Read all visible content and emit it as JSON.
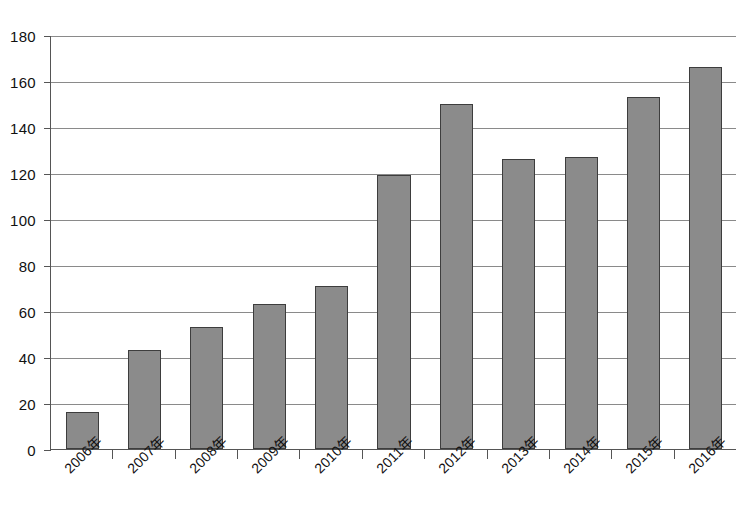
{
  "title": "",
  "chart_data": {
    "type": "bar",
    "title": "",
    "xlabel": "",
    "ylabel": "",
    "categories": [
      "2006年",
      "2007年",
      "2008年",
      "2009年",
      "2010年",
      "2011年",
      "2012年",
      "2013年",
      "2014年",
      "2015年",
      "2016年"
    ],
    "values": [
      16,
      43,
      53,
      63,
      71,
      119,
      150,
      126,
      127,
      153,
      166
    ],
    "series": [
      {
        "name": "件数",
        "values": [
          16,
          43,
          53,
          63,
          71,
          119,
          150,
          126,
          127,
          153,
          166
        ]
      }
    ],
    "ylim": [
      0,
      180
    ],
    "ytick_values": [
      0,
      20,
      40,
      60,
      80,
      100,
      120,
      140,
      160,
      180
    ],
    "ytick_labels": [
      "0",
      "20",
      "40",
      "60",
      "80",
      "100",
      "120",
      "140",
      "160",
      "180"
    ],
    "grid": true,
    "grid_axis": "y",
    "legend": false,
    "legend_position": "none",
    "bar_color": "#8b8b8b",
    "bar_edge_color": "#3d3d3d",
    "axis_color": "#555555",
    "gridline_color": "#8a8a8a",
    "text_color": "#111111",
    "xlabel_rotation": -45
  }
}
